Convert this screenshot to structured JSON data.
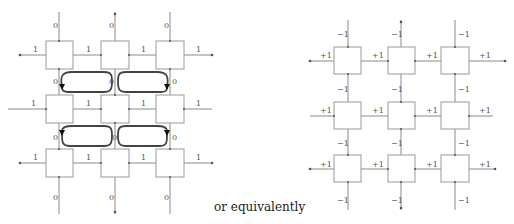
{
  "caption": "or equivalently",
  "left_diagram": {
    "description": "3x3 grid of boxes with edge labels 1 (horizontal) and 0 (vertical), with four circulating loop arrows between boxes",
    "horizontal_label": "1",
    "vertical_label": "0",
    "loops": [
      {
        "position": "upper-left",
        "direction": "counterclockwise"
      },
      {
        "position": "upper-right",
        "direction": "clockwise"
      },
      {
        "position": "lower-left",
        "direction": "counterclockwise"
      },
      {
        "position": "lower-right",
        "direction": "clockwise"
      }
    ]
  },
  "right_diagram": {
    "description": "3x3 grid of boxes with edge labels +1 (horizontal) and -1 (vertical)",
    "horizontal_label": "+1",
    "vertical_label": "−1"
  },
  "colors": {
    "line": "#888888",
    "loop": "#444444",
    "box": "#999999"
  }
}
